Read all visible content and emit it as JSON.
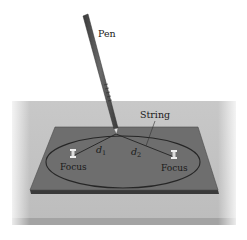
{
  "figure": {
    "labels": {
      "pen": "Pen",
      "string": "String",
      "d1_base": "d",
      "d1_sub": "1",
      "d2_base": "d",
      "d2_sub": "2",
      "focus_left": "Focus",
      "focus_right": "Focus"
    },
    "colors": {
      "background": "#ffffff",
      "table_surface": "#c4c4c4",
      "table_edge": "#9a9a9a",
      "board": "#6e6e6e",
      "board_edge": "#3a3a3a",
      "ellipse": "#262626",
      "string": "#2a2a2a",
      "pen_body": "#555555",
      "pen_tip": "#e8e8e8",
      "pin": "#e6e6e6"
    }
  }
}
